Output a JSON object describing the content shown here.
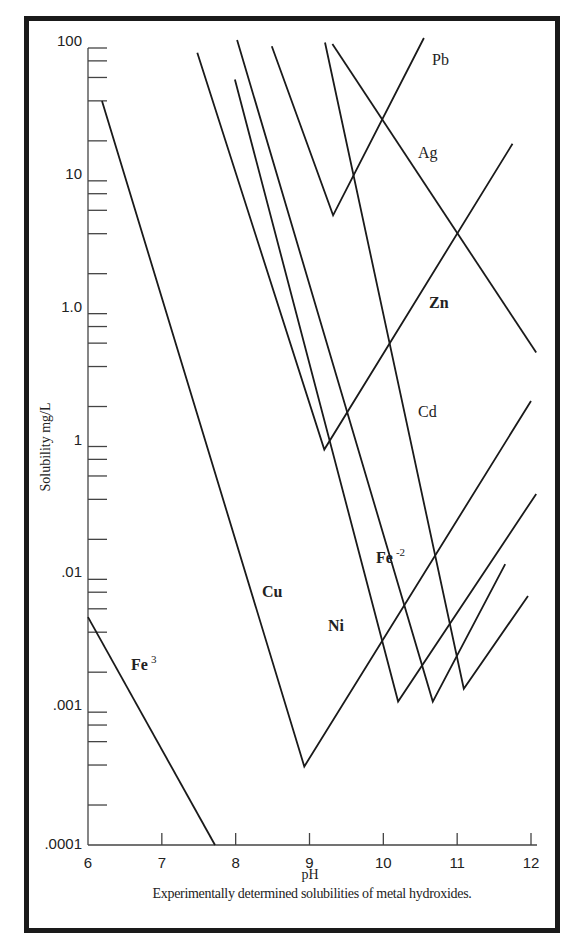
{
  "chart_data": {
    "type": "line",
    "title": "",
    "caption": "Experimentally determined solubilities of metal hydroxides.",
    "xlabel": "pH",
    "ylabel": "Solubility mg/L",
    "xlim": [
      6,
      12
    ],
    "ylim": [
      0.0001,
      100
    ],
    "yscale": "log",
    "grid": false,
    "legend": "inline labels",
    "x_ticks": [
      "6",
      "7",
      "8",
      "9",
      "10",
      "11",
      "12"
    ],
    "y_ticks": [
      "100",
      "10",
      "1.0",
      "1",
      ".01",
      ".001",
      ".0001"
    ],
    "series": [
      {
        "name": "Fe3",
        "label": "Fe",
        "label_sup": "3",
        "points": [
          [
            6.0,
            0.0052
          ],
          [
            7.72,
            0.0001
          ]
        ]
      },
      {
        "name": "Cu",
        "label": "Cu",
        "points": [
          [
            6.19,
            40
          ],
          [
            8.93,
            0.00039
          ],
          [
            12.0,
            0.22
          ]
        ]
      },
      {
        "name": "Zn",
        "label": "Zn",
        "points": [
          [
            7.48,
            92
          ],
          [
            9.2,
            0.095
          ],
          [
            11.75,
            19
          ]
        ]
      },
      {
        "name": "Ni",
        "label": "Ni",
        "points": [
          [
            7.99,
            58
          ],
          [
            10.2,
            0.0012
          ],
          [
            12.07,
            0.044
          ]
        ]
      },
      {
        "name": "Fe-2",
        "label": "Fe",
        "label_sup": "-2",
        "points": [
          [
            8.02,
            115
          ],
          [
            10.67,
            0.0012
          ],
          [
            11.65,
            0.013
          ]
        ]
      },
      {
        "name": "Cd",
        "label": "Cd",
        "points": [
          [
            9.21,
            110
          ],
          [
            11.09,
            0.0015
          ],
          [
            11.96,
            0.0075
          ]
        ]
      },
      {
        "name": "Pb",
        "label": "Pb",
        "points": [
          [
            8.49,
            103
          ],
          [
            9.32,
            5.5
          ],
          [
            10.55,
            119
          ]
        ]
      },
      {
        "name": "Ag",
        "label": "Ag",
        "points": [
          [
            9.31,
            107
          ],
          [
            12.07,
            0.51
          ]
        ]
      }
    ]
  }
}
